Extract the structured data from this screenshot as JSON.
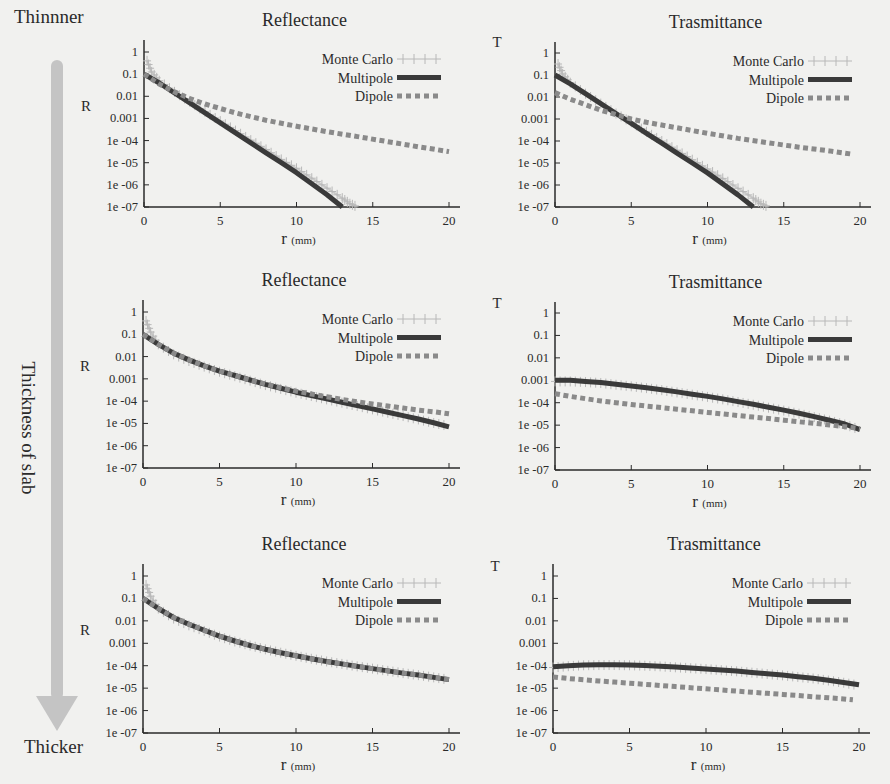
{
  "side": {
    "top_label": "Thinnner",
    "middle_label": "Thickness of slab",
    "bottom_label": "Thicker",
    "arrow_color": "#c4c4c4"
  },
  "colors": {
    "background": "#f1f1ef",
    "axis": "#2a2a2a",
    "monte_carlo": "#b8b8b8",
    "multipole": "#3a3a3a",
    "dipole": "#8a8a8a"
  },
  "legend": [
    "Monte Carlo",
    "Multipole",
    "Dipole"
  ],
  "chart_data": [
    {
      "id": "thin-reflectance",
      "type": "line",
      "title": "Reflectance",
      "xlabel": "r",
      "xlabel_unit": "(mm)",
      "ylabel": "R",
      "yscale": "log",
      "ylim": [
        1e-07,
        1
      ],
      "xlim": [
        0,
        20
      ],
      "x_ticks": [
        "0",
        "5",
        "10",
        "15",
        "20"
      ],
      "y_ticks": [
        "1",
        "0.1",
        "0.01",
        "0.001",
        "1e -04",
        "1e -05",
        "1e -06",
        "1e -07"
      ],
      "legend_position": "top-right",
      "grid": false,
      "box": {
        "x0": 144,
        "x20": 449,
        "y_top": 52,
        "y_bot": 207,
        "axis_right": 460,
        "axis_top": 40
      },
      "series": [
        {
          "name": "Multipole",
          "x": [
            0,
            1,
            2,
            3,
            4,
            5,
            6,
            7,
            8,
            9,
            10,
            11,
            12,
            13
          ],
          "log10": [
            -1.0,
            -1.4,
            -1.85,
            -2.3,
            -2.75,
            -3.2,
            -3.65,
            -4.1,
            -4.55,
            -5.0,
            -5.45,
            -5.95,
            -6.45,
            -7.0
          ]
        },
        {
          "name": "Dipole",
          "x": [
            0,
            1,
            2,
            3,
            4,
            5,
            6,
            7,
            8,
            9,
            10,
            12,
            14,
            16,
            18,
            20
          ],
          "log10": [
            -1.0,
            -1.45,
            -1.8,
            -2.1,
            -2.35,
            -2.55,
            -2.75,
            -2.92,
            -3.08,
            -3.22,
            -3.35,
            -3.6,
            -3.82,
            -4.05,
            -4.28,
            -4.5
          ]
        },
        {
          "name": "Monte Carlo",
          "x": [
            0.2,
            0.5,
            1,
            2,
            3,
            4,
            5,
            6,
            7,
            8,
            9,
            10,
            11,
            12,
            13,
            13.5,
            14
          ],
          "log10": [
            -0.4,
            -0.9,
            -1.3,
            -1.8,
            -2.25,
            -2.7,
            -3.12,
            -3.55,
            -3.98,
            -4.4,
            -4.85,
            -5.25,
            -5.7,
            -6.15,
            -6.6,
            -6.85,
            -7.0
          ]
        }
      ]
    },
    {
      "id": "thin-transmittance",
      "type": "line",
      "title": "Trasmittance",
      "xlabel": "r",
      "xlabel_unit": "(mm)",
      "ylabel": "T",
      "yscale": "log",
      "ylim": [
        1e-07,
        1
      ],
      "xlim": [
        0,
        20
      ],
      "x_ticks": [
        "0",
        "5",
        "10",
        "15",
        "20"
      ],
      "y_ticks": [
        "1",
        "0.1",
        "0.01",
        "0.001",
        "1e -04",
        "1e -05",
        "1e -06",
        "1e -07"
      ],
      "legend_position": "top-right",
      "grid": false,
      "box": {
        "x0": 555,
        "x20": 860,
        "y_top": 53,
        "y_bot": 207,
        "axis_right": 871,
        "axis_top": 42
      },
      "series": [
        {
          "name": "Multipole",
          "x": [
            0,
            1,
            2,
            3,
            4,
            5,
            6,
            7,
            8,
            9,
            10,
            11,
            12,
            13
          ],
          "log10": [
            -1.0,
            -1.4,
            -1.85,
            -2.3,
            -2.75,
            -3.2,
            -3.65,
            -4.1,
            -4.55,
            -5.0,
            -5.45,
            -5.95,
            -6.45,
            -7.0
          ]
        },
        {
          "name": "Dipole",
          "x": [
            0,
            1,
            2,
            3,
            4,
            5,
            6,
            8,
            10,
            12,
            14,
            16,
            18,
            19.5
          ],
          "log10": [
            -1.8,
            -2.1,
            -2.35,
            -2.6,
            -2.8,
            -3.0,
            -3.15,
            -3.4,
            -3.65,
            -3.88,
            -4.08,
            -4.28,
            -4.45,
            -4.6
          ]
        },
        {
          "name": "Monte Carlo",
          "x": [
            0.2,
            0.5,
            1,
            2,
            3,
            4,
            5,
            6,
            7,
            8,
            9,
            10,
            11,
            12,
            13,
            13.5,
            14
          ],
          "log10": [
            -0.5,
            -0.95,
            -1.35,
            -1.85,
            -2.3,
            -2.75,
            -3.15,
            -3.58,
            -4.0,
            -4.42,
            -4.85,
            -5.27,
            -5.7,
            -6.15,
            -6.6,
            -6.85,
            -7.0
          ]
        }
      ]
    },
    {
      "id": "mid-reflectance",
      "type": "line",
      "title": "Reflectance",
      "xlabel": "r",
      "xlabel_unit": "(mm)",
      "ylabel": "R",
      "yscale": "log",
      "ylim": [
        1e-07,
        1
      ],
      "xlim": [
        0,
        20
      ],
      "x_ticks": [
        "0",
        "5",
        "10",
        "15",
        "20"
      ],
      "y_ticks": [
        "1",
        "0.1",
        "0.01",
        "0.001",
        "1e -04",
        "1e -05",
        "1e -06",
        "1e -07"
      ],
      "legend_position": "top-right",
      "grid": false,
      "box": {
        "x0": 143,
        "x20": 449,
        "y_top": 312,
        "y_bot": 468,
        "axis_right": 460,
        "axis_top": 300
      },
      "series": [
        {
          "name": "Multipole",
          "x": [
            0,
            1,
            2,
            3,
            4,
            5,
            6,
            7,
            8,
            9,
            10,
            11,
            12,
            13,
            14,
            15,
            16,
            17,
            18,
            19,
            20
          ],
          "log10": [
            -1.0,
            -1.45,
            -1.85,
            -2.15,
            -2.42,
            -2.65,
            -2.85,
            -3.05,
            -3.25,
            -3.42,
            -3.6,
            -3.75,
            -3.9,
            -4.05,
            -4.2,
            -4.35,
            -4.5,
            -4.65,
            -4.8,
            -4.97,
            -5.15
          ]
        },
        {
          "name": "Dipole",
          "x": [
            0,
            1,
            2,
            3,
            4,
            5,
            6,
            7,
            8,
            9,
            10,
            11,
            12,
            13,
            14,
            15,
            16,
            17,
            18,
            19,
            20
          ],
          "log10": [
            -1.0,
            -1.45,
            -1.85,
            -2.15,
            -2.42,
            -2.65,
            -2.85,
            -3.05,
            -3.23,
            -3.4,
            -3.55,
            -3.68,
            -3.8,
            -3.92,
            -4.03,
            -4.13,
            -4.22,
            -4.31,
            -4.4,
            -4.48,
            -4.57
          ]
        },
        {
          "name": "Monte Carlo",
          "x": [
            0.2,
            0.5,
            1,
            2,
            3,
            4,
            5,
            6,
            7,
            8,
            9,
            10,
            11,
            12,
            13,
            14,
            15,
            16,
            17,
            18,
            19,
            20
          ],
          "log10": [
            -0.4,
            -0.9,
            -1.45,
            -1.9,
            -2.2,
            -2.45,
            -2.68,
            -2.88,
            -3.08,
            -3.28,
            -3.45,
            -3.62,
            -3.77,
            -3.92,
            -4.07,
            -4.22,
            -4.37,
            -4.52,
            -4.67,
            -4.82,
            -4.98,
            -5.12
          ]
        }
      ]
    },
    {
      "id": "mid-transmittance",
      "type": "line",
      "title": "Trasmittance",
      "xlabel": "r",
      "xlabel_unit": "(mm)",
      "ylabel": "T",
      "yscale": "log",
      "ylim": [
        1e-07,
        1
      ],
      "xlim": [
        0,
        20
      ],
      "x_ticks": [
        "0",
        "5",
        "10",
        "15",
        "20"
      ],
      "y_ticks": [
        "1",
        "0.1",
        "0.01",
        "0.001",
        "1e -04",
        "1e -05",
        "1e -06",
        "1e -07"
      ],
      "legend_position": "top-right",
      "grid": false,
      "box": {
        "x0": 555,
        "x20": 860,
        "y_top": 313,
        "y_bot": 470,
        "axis_right": 871,
        "axis_top": 302
      },
      "series": [
        {
          "name": "Multipole",
          "x": [
            0,
            1,
            2,
            3,
            4,
            5,
            6,
            7,
            8,
            9,
            10,
            11,
            12,
            13,
            14,
            15,
            16,
            17,
            18,
            19,
            20
          ],
          "log10": [
            -3.0,
            -3.0,
            -3.05,
            -3.1,
            -3.18,
            -3.25,
            -3.33,
            -3.42,
            -3.52,
            -3.62,
            -3.72,
            -3.83,
            -3.95,
            -4.07,
            -4.2,
            -4.33,
            -4.47,
            -4.62,
            -4.78,
            -4.95,
            -5.2
          ]
        },
        {
          "name": "Dipole",
          "x": [
            0,
            1,
            2,
            3,
            4,
            5,
            6,
            7,
            8,
            9,
            10,
            11,
            12,
            13,
            14,
            15,
            16,
            17,
            18,
            19,
            20
          ],
          "log10": [
            -3.6,
            -3.72,
            -3.82,
            -3.92,
            -4.0,
            -4.08,
            -4.15,
            -4.22,
            -4.29,
            -4.36,
            -4.43,
            -4.5,
            -4.57,
            -4.64,
            -4.71,
            -4.78,
            -4.85,
            -4.92,
            -4.99,
            -5.07,
            -5.15
          ]
        },
        {
          "name": "Monte Carlo",
          "x": [
            0,
            1,
            2,
            3,
            4,
            5,
            6,
            7,
            8,
            9,
            10,
            11,
            12,
            13,
            14,
            15,
            16,
            17,
            18,
            19,
            20
          ],
          "log10": [
            -3.05,
            -3.05,
            -3.08,
            -3.12,
            -3.2,
            -3.27,
            -3.35,
            -3.44,
            -3.54,
            -3.64,
            -3.74,
            -3.85,
            -3.97,
            -4.09,
            -4.22,
            -4.35,
            -4.49,
            -4.64,
            -4.8,
            -4.97,
            -5.2
          ]
        }
      ]
    },
    {
      "id": "thick-reflectance",
      "type": "line",
      "title": "Reflectance",
      "xlabel": "r",
      "xlabel_unit": "(mm)",
      "ylabel": "R",
      "yscale": "log",
      "ylim": [
        1e-07,
        1
      ],
      "xlim": [
        0,
        20
      ],
      "x_ticks": [
        "0",
        "5",
        "10",
        "15",
        "20"
      ],
      "y_ticks": [
        "1",
        "0.1",
        "0.01",
        "0.001",
        "1e -04",
        "1e -05",
        "1e -06",
        "1e -07"
      ],
      "legend_position": "top-right",
      "grid": false,
      "box": {
        "x0": 143,
        "x20": 449,
        "y_top": 576,
        "y_bot": 733,
        "axis_right": 460,
        "axis_top": 564
      },
      "series": [
        {
          "name": "Multipole",
          "x": [
            0,
            1,
            2,
            3,
            4,
            5,
            6,
            7,
            8,
            9,
            10,
            11,
            12,
            13,
            14,
            15,
            16,
            17,
            18,
            19,
            20
          ],
          "log10": [
            -1.0,
            -1.45,
            -1.85,
            -2.15,
            -2.42,
            -2.68,
            -2.9,
            -3.1,
            -3.27,
            -3.42,
            -3.56,
            -3.69,
            -3.81,
            -3.92,
            -4.03,
            -4.13,
            -4.23,
            -4.33,
            -4.42,
            -4.52,
            -4.62
          ]
        },
        {
          "name": "Dipole",
          "x": [
            0,
            1,
            2,
            3,
            4,
            5,
            6,
            7,
            8,
            9,
            10,
            11,
            12,
            13,
            14,
            15,
            16,
            17,
            18,
            19,
            20
          ],
          "log10": [
            -1.0,
            -1.45,
            -1.85,
            -2.15,
            -2.42,
            -2.68,
            -2.9,
            -3.1,
            -3.27,
            -3.42,
            -3.56,
            -3.69,
            -3.81,
            -3.92,
            -4.03,
            -4.13,
            -4.23,
            -4.33,
            -4.42,
            -4.52,
            -4.62
          ]
        },
        {
          "name": "Monte Carlo",
          "x": [
            0.2,
            0.5,
            1,
            2,
            3,
            4,
            5,
            6,
            7,
            8,
            9,
            10,
            11,
            12,
            13,
            14,
            15,
            16,
            17,
            18,
            19,
            20
          ],
          "log10": [
            -0.4,
            -0.9,
            -1.45,
            -1.9,
            -2.2,
            -2.45,
            -2.7,
            -2.92,
            -3.1,
            -3.27,
            -3.42,
            -3.56,
            -3.69,
            -3.81,
            -3.92,
            -4.03,
            -4.13,
            -4.23,
            -4.33,
            -4.42,
            -4.52,
            -4.62
          ]
        }
      ]
    },
    {
      "id": "thick-transmittance",
      "type": "line",
      "title": "Trasmittance",
      "xlabel": "r",
      "xlabel_unit": "(mm)",
      "ylabel": "T",
      "yscale": "log",
      "ylim": [
        1e-07,
        1
      ],
      "xlim": [
        0,
        20
      ],
      "x_ticks": [
        "0",
        "5",
        "10",
        "15",
        "20"
      ],
      "y_ticks": [
        "1",
        "0.1",
        "0.01",
        "0.001",
        "1e -04",
        "1e -05",
        "1e -06",
        "1e -07"
      ],
      "legend_position": "top-right",
      "grid": false,
      "box": {
        "x0": 553,
        "x20": 859,
        "y_top": 576,
        "y_bot": 733,
        "axis_right": 870,
        "axis_top": 564
      },
      "series": [
        {
          "name": "Multipole",
          "x": [
            0,
            1,
            2,
            3,
            4,
            5,
            6,
            7,
            8,
            9,
            10,
            11,
            12,
            13,
            14,
            15,
            16,
            17,
            18,
            19,
            20
          ],
          "log10": [
            -4.05,
            -4.0,
            -3.97,
            -3.96,
            -3.96,
            -3.97,
            -3.99,
            -4.02,
            -4.06,
            -4.1,
            -4.14,
            -4.19,
            -4.24,
            -4.3,
            -4.36,
            -4.42,
            -4.49,
            -4.56,
            -4.65,
            -4.75,
            -4.85
          ]
        },
        {
          "name": "Dipole",
          "x": [
            0,
            1,
            2,
            3,
            4,
            5,
            6,
            7,
            8,
            9,
            10,
            11,
            12,
            13,
            14,
            15,
            16,
            17,
            18,
            19,
            19.6
          ],
          "log10": [
            -4.5,
            -4.57,
            -4.63,
            -4.68,
            -4.73,
            -4.78,
            -4.83,
            -4.88,
            -4.93,
            -4.98,
            -5.03,
            -5.08,
            -5.13,
            -5.18,
            -5.23,
            -5.28,
            -5.33,
            -5.38,
            -5.43,
            -5.48,
            -5.52
          ]
        },
        {
          "name": "Monte Carlo",
          "x": [
            0,
            1,
            2,
            3,
            4,
            5,
            6,
            7,
            8,
            9,
            10,
            11,
            12,
            13,
            14,
            15,
            16,
            17,
            18,
            19,
            20
          ],
          "log10": [
            -4.08,
            -4.02,
            -3.98,
            -3.97,
            -3.97,
            -3.98,
            -4.0,
            -4.03,
            -4.07,
            -4.11,
            -4.15,
            -4.2,
            -4.25,
            -4.31,
            -4.37,
            -4.43,
            -4.5,
            -4.57,
            -4.66,
            -4.76,
            -4.88
          ]
        }
      ]
    }
  ]
}
